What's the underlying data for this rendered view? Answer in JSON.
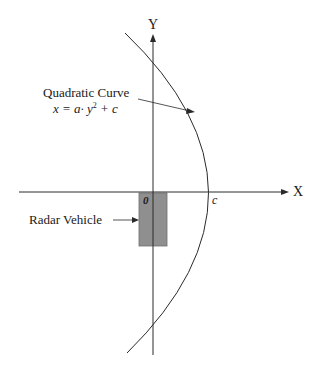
{
  "diagram": {
    "type": "coordinate-sketch",
    "axes": {
      "x_label": "X",
      "y_label": "Y",
      "origin_label": "0",
      "vertex_label": "c"
    },
    "annotations": {
      "curve_title": "Quadratic Curve",
      "curve_equation_prefix": "x = a· y",
      "curve_equation_exponent": "2",
      "curve_equation_suffix": " + c",
      "vehicle_label": "Radar Vehicle"
    },
    "colors": {
      "line": "#2a2a2a",
      "vehicle_fill": "#8f8f8f",
      "background": "#ffffff"
    }
  }
}
